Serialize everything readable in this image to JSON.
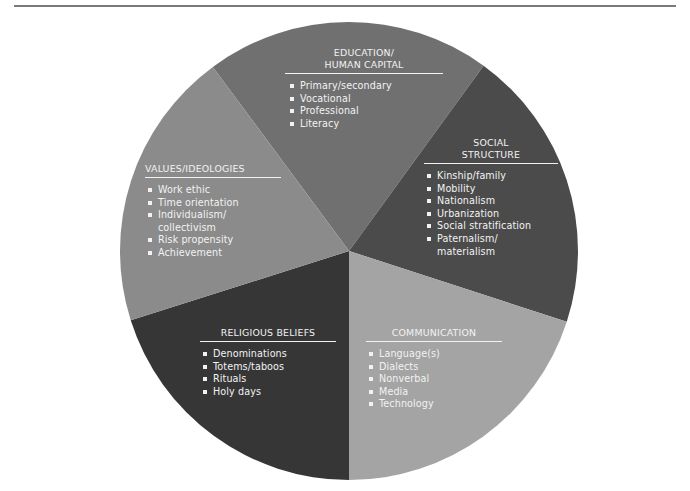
{
  "diagram": {
    "type": "pie-segments",
    "center": [
      349,
      251
    ],
    "radius": 229,
    "segments": [
      {
        "id": "education",
        "title": "EDUCATION/\nHUMAN CAPITAL",
        "color": "#707070",
        "start_angle": -126.5,
        "end_angle": -54,
        "items": [
          "Primary/secondary",
          "Vocational",
          "Professional",
          "Literacy"
        ]
      },
      {
        "id": "social",
        "title": "SOCIAL\nSTRUCTURE",
        "color": "#4b4b4b",
        "start_angle": -54,
        "end_angle": 18,
        "items": [
          "Kinship/family",
          "Mobility",
          "Nationalism",
          "Urbanization",
          "Social stratification",
          "Paternalism/\nmaterialism"
        ]
      },
      {
        "id": "communication",
        "title": "COMMUNICATION",
        "color": "#a4a4a4",
        "start_angle": 18,
        "end_angle": 90,
        "items": [
          "Language(s)",
          "Dialects",
          "Nonverbal",
          "Media",
          "Technology"
        ]
      },
      {
        "id": "religious",
        "title": "RELIGIOUS BELIEFS",
        "color": "#363636",
        "start_angle": 90,
        "end_angle": 162.4,
        "items": [
          "Denominations",
          "Totems/taboos",
          "Rituals",
          "Holy days"
        ]
      },
      {
        "id": "values",
        "title": "VALUES/IDEOLOGIES",
        "color": "#8b8b8b",
        "start_angle": 162.4,
        "end_angle": 233.5,
        "items": [
          "Work ethic",
          "Time orientation",
          "Individualism/\ncollectivism",
          "Risk propensity",
          "Achievement"
        ]
      }
    ]
  },
  "colors": {
    "text": "#f2f2f2",
    "rule": "#7a7a7a",
    "background": "#ffffff"
  }
}
